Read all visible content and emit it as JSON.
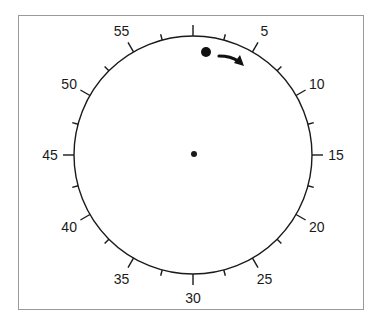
{
  "diagram": {
    "type": "circular-dial",
    "title": "",
    "center": {
      "x": 193,
      "y": 155
    },
    "radius": 119,
    "stroke_color": "#1a1a1a",
    "frame_color": "#9a9a9a",
    "labels": [
      {
        "value": "5",
        "position": 5
      },
      {
        "value": "10",
        "position": 10
      },
      {
        "value": "15",
        "position": 15
      },
      {
        "value": "20",
        "position": 20
      },
      {
        "value": "25",
        "position": 25
      },
      {
        "value": "30",
        "position": 30
      },
      {
        "value": "35",
        "position": 35
      },
      {
        "value": "40",
        "position": 40
      },
      {
        "value": "45",
        "position": 45
      },
      {
        "value": "50",
        "position": 50
      },
      {
        "value": "55",
        "position": 55
      }
    ],
    "major_ticks": [
      0,
      5,
      10,
      15,
      20,
      25,
      30,
      35,
      40,
      45,
      50,
      55
    ],
    "minor_ticks": [
      2.5,
      7.5,
      12.5,
      17.5,
      22.5,
      27.5,
      32.5,
      37.5,
      42.5,
      47.5,
      52.5,
      57.5
    ],
    "scale_max": 60,
    "center_dot": {
      "x": 194,
      "y": 154,
      "r": 3
    },
    "marker_dot": {
      "x": 206,
      "y": 52,
      "r": 5,
      "description": "large dot near position 1"
    },
    "arrow": {
      "direction": "clockwise",
      "from": {
        "x": 219,
        "y": 56
      },
      "to": {
        "x": 243,
        "y": 64
      }
    }
  }
}
